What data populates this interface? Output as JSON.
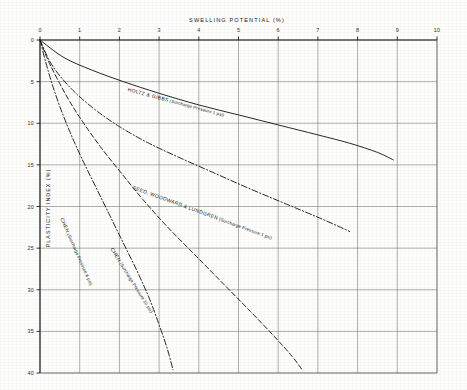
{
  "chart_data": {
    "type": "line",
    "title": "SWELLING POTENTIAL (%)",
    "xlabel": "SWELLING POTENTIAL (%)",
    "ylabel": "PLASTICITY INDEX (%)",
    "xlim": [
      0,
      10
    ],
    "ylim": [
      0,
      40
    ],
    "y_axis_inverted": true,
    "grid": true,
    "x_ticks": [
      "0",
      "1",
      "2",
      "3",
      "4",
      "5",
      "6",
      "7",
      "8",
      "9",
      "10"
    ],
    "x_tick_values": [
      0,
      1,
      2,
      3,
      4,
      5,
      6,
      7,
      8,
      9,
      10
    ],
    "y_ticks": [
      "0",
      "5",
      "10",
      "15",
      "20",
      "25",
      "30",
      "35",
      "40"
    ],
    "y_tick_values": [
      0,
      5,
      10,
      15,
      20,
      25,
      30,
      35,
      40
    ],
    "legend_position": "inline-on-curve",
    "series": [
      {
        "name": "HOLTZ & GIBBS",
        "annotation": "(Surcharge Pressure 1 psi)",
        "style": "solid",
        "points": [
          [
            0,
            0
          ],
          [
            0.6,
            2.1
          ],
          [
            1.3,
            3.6
          ],
          [
            2.1,
            5.0
          ],
          [
            3.0,
            6.4
          ],
          [
            4.0,
            7.8
          ],
          [
            5.0,
            9.0
          ],
          [
            6.0,
            10.2
          ],
          [
            7.0,
            11.4
          ],
          [
            7.8,
            12.4
          ],
          [
            8.5,
            13.5
          ],
          [
            8.9,
            14.4
          ]
        ]
      },
      {
        "name": "SEED, WOODWARD & LUNDGREN",
        "annotation": "(Surcharge Pressure 1 psi)",
        "style": "dash-dot",
        "points": [
          [
            0,
            0
          ],
          [
            0.25,
            2.6
          ],
          [
            0.55,
            4.6
          ],
          [
            0.95,
            6.6
          ],
          [
            1.45,
            8.6
          ],
          [
            2.0,
            10.4
          ],
          [
            2.7,
            12.3
          ],
          [
            3.5,
            14.1
          ],
          [
            4.4,
            16.0
          ],
          [
            5.3,
            17.9
          ],
          [
            6.2,
            19.7
          ],
          [
            7.1,
            21.5
          ],
          [
            7.8,
            23.0
          ]
        ]
      },
      {
        "name": "CHEN",
        "annotation": "(Surcharge Pressure 10 psi)",
        "style": "dashed",
        "points": [
          [
            0,
            0
          ],
          [
            0.2,
            2.4
          ],
          [
            0.45,
            4.8
          ],
          [
            0.75,
            7.4
          ],
          [
            1.1,
            10.0
          ],
          [
            1.55,
            13.0
          ],
          [
            2.05,
            16.0
          ],
          [
            2.6,
            19.2
          ],
          [
            3.2,
            22.4
          ],
          [
            3.9,
            25.8
          ],
          [
            4.6,
            29.2
          ],
          [
            5.3,
            32.6
          ],
          [
            5.9,
            35.6
          ],
          [
            6.35,
            38.0
          ],
          [
            6.6,
            39.6
          ]
        ]
      },
      {
        "name": "CHEN",
        "annotation": "(Surcharge Pressure 6 psi)",
        "style": "dash-dot",
        "points": [
          [
            0,
            0
          ],
          [
            0.14,
            2.6
          ],
          [
            0.3,
            5.2
          ],
          [
            0.5,
            8.0
          ],
          [
            0.75,
            11.0
          ],
          [
            1.05,
            14.2
          ],
          [
            1.4,
            17.6
          ],
          [
            1.75,
            21.0
          ],
          [
            2.1,
            24.4
          ],
          [
            2.45,
            27.8
          ],
          [
            2.75,
            31.0
          ],
          [
            3.0,
            34.2
          ],
          [
            3.2,
            37.0
          ],
          [
            3.35,
            39.6
          ]
        ]
      }
    ]
  },
  "labels": {
    "holtz_name": "HOLTZ & GIBBS",
    "holtz_note": "(Surcharge Pressure 1 psi)",
    "seed_name": "SEED, WOODWARD & LUNDGREN",
    "seed_note": "(Surcharge Pressure 1 psi)",
    "chen10_name": "CHEN",
    "chen10_note": "(Surcharge Pressure 10 psi)",
    "chen6_name": "CHEN",
    "chen6_note": "(Surcharge Pressure 6 psi)"
  },
  "colors": {
    "ink": "#1b1b1b",
    "grid": "#6e6e6e",
    "paper": "#fdfdfb"
  }
}
